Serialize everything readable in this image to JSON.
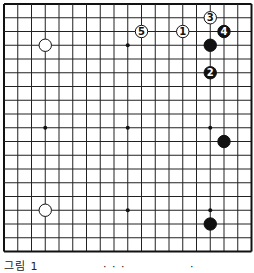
{
  "board": {
    "size": 19,
    "origin": [
      4,
      4
    ],
    "spacing": 13.75,
    "line_color": "#222222",
    "border_color": "#111111",
    "star_points": [
      [
        3,
        3
      ],
      [
        9,
        3
      ],
      [
        15,
        3
      ],
      [
        3,
        9
      ],
      [
        9,
        9
      ],
      [
        15,
        9
      ],
      [
        3,
        15
      ],
      [
        9,
        15
      ],
      [
        15,
        15
      ]
    ],
    "stones": [
      {
        "color": "white",
        "col": 3,
        "row": 3,
        "label": ""
      },
      {
        "color": "black",
        "col": 15,
        "row": 3,
        "label": ""
      },
      {
        "color": "white",
        "col": 13,
        "row": 2,
        "label": "1"
      },
      {
        "color": "black",
        "col": 15,
        "row": 5,
        "label": "2"
      },
      {
        "color": "white",
        "col": 15,
        "row": 1,
        "label": "3"
      },
      {
        "color": "black",
        "col": 16,
        "row": 2,
        "label": "4"
      },
      {
        "color": "white",
        "col": 10,
        "row": 2,
        "label": "5"
      },
      {
        "color": "black",
        "col": 16,
        "row": 10,
        "label": ""
      },
      {
        "color": "white",
        "col": 3,
        "row": 15,
        "label": ""
      },
      {
        "color": "black",
        "col": 15,
        "row": 16,
        "label": ""
      }
    ]
  },
  "caption": {
    "parts": [
      "그림 1",
      "· · ·",
      "·"
    ]
  }
}
